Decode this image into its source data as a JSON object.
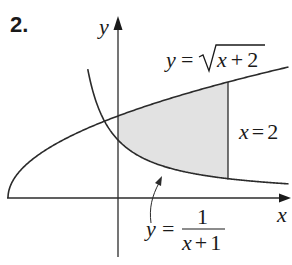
{
  "problem_number": "2.",
  "axes": {
    "x_label": "x",
    "y_label": "y"
  },
  "curves": [
    {
      "name": "upper",
      "label_lhs": "y",
      "label_eq": "=",
      "label_rhs": "√x + 2",
      "radicand": "x + 2",
      "formula": "y = sqrt(x + 2)"
    },
    {
      "name": "lower",
      "label_lhs": "y",
      "label_eq": "=",
      "numerator": "1",
      "denominator": "x + 1",
      "formula": "y = 1/(x + 1)"
    }
  ],
  "boundary": {
    "label": "x = 2",
    "value": 2
  },
  "shaded_region": {
    "x_from": 0,
    "x_to": 2,
    "fill": "#e2e2e2"
  },
  "colors": {
    "ink": "#2b2b2b",
    "shade": "#e2e2e2",
    "background": "#ffffff"
  }
}
